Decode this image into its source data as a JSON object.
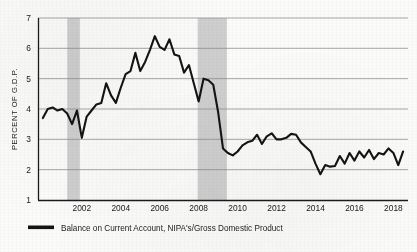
{
  "chart_data": {
    "type": "line",
    "title": "",
    "subtitle": "",
    "xlabel": "",
    "ylabel": "PERCENT OF G.D.P.",
    "xlim": [
      1999.75,
      2018.75
    ],
    "ylim": [
      1,
      7
    ],
    "yticks": [
      1,
      2,
      3,
      4,
      5,
      6,
      7
    ],
    "ytick_labels": [
      "1",
      "2",
      "3",
      "4",
      "5",
      "6",
      "7"
    ],
    "xticks": [
      2002,
      2004,
      2006,
      2008,
      2010,
      2012,
      2014,
      2016,
      2018
    ],
    "xtick_labels": [
      "2002",
      "2004",
      "2006",
      "2008",
      "2010",
      "2012",
      "2014",
      "2016",
      "2018"
    ],
    "grid": "horizontal",
    "legend_position": "below-left",
    "line_color": "#141414",
    "grid_color": "#8b8b8b",
    "axis_color": "#1b1b1b",
    "shading_color": "#cfcfcf",
    "background_color": "#fbfbfa",
    "shaded_regions": [
      {
        "label": "recession",
        "x_start": 2001.25,
        "x_end": 2001.9
      },
      {
        "label": "recession",
        "x_start": 2007.95,
        "x_end": 2009.45
      }
    ],
    "series": [
      {
        "name": "Balance on Current Account, NIPA's/Gross Domestic Product",
        "color": "#141414",
        "x": [
          2000.0,
          2000.25,
          2000.5,
          2000.75,
          2001.0,
          2001.25,
          2001.5,
          2001.75,
          2002.0,
          2002.25,
          2002.5,
          2002.75,
          2003.0,
          2003.25,
          2003.5,
          2003.75,
          2004.0,
          2004.25,
          2004.5,
          2004.75,
          2005.0,
          2005.25,
          2005.5,
          2005.75,
          2006.0,
          2006.25,
          2006.5,
          2006.75,
          2007.0,
          2007.25,
          2007.5,
          2007.75,
          2008.0,
          2008.25,
          2008.5,
          2008.75,
          2009.0,
          2009.25,
          2009.5,
          2009.75,
          2010.0,
          2010.25,
          2010.5,
          2010.75,
          2011.0,
          2011.25,
          2011.5,
          2011.75,
          2012.0,
          2012.25,
          2012.5,
          2012.75,
          2013.0,
          2013.25,
          2013.5,
          2013.75,
          2014.0,
          2014.25,
          2014.5,
          2014.75,
          2015.0,
          2015.25,
          2015.5,
          2015.75,
          2016.0,
          2016.25,
          2016.5,
          2016.75,
          2017.0,
          2017.25,
          2017.5,
          2017.75,
          2018.0,
          2018.25,
          2018.5
        ],
        "values": [
          3.7,
          4.0,
          4.05,
          3.95,
          4.0,
          3.85,
          3.5,
          3.95,
          3.05,
          3.75,
          3.95,
          4.15,
          4.2,
          4.85,
          4.45,
          4.2,
          4.7,
          5.15,
          5.25,
          5.85,
          5.25,
          5.55,
          5.95,
          6.4,
          6.05,
          5.95,
          6.3,
          5.8,
          5.75,
          5.2,
          5.45,
          4.85,
          4.25,
          5.0,
          4.95,
          4.8,
          3.9,
          2.7,
          2.55,
          2.47,
          2.6,
          2.8,
          2.9,
          2.95,
          3.15,
          2.85,
          3.1,
          3.2,
          3.0,
          3.0,
          3.05,
          3.18,
          3.15,
          2.9,
          2.75,
          2.6,
          2.2,
          1.85,
          2.15,
          2.1,
          2.12,
          2.45,
          2.2,
          2.55,
          2.3,
          2.6,
          2.4,
          2.65,
          2.35,
          2.55,
          2.5,
          2.7,
          2.55,
          2.15,
          2.6
        ]
      }
    ]
  },
  "legend": {
    "items": [
      {
        "swatch_color": "#141414",
        "label": "Balance on Current Account, NIPA's/Gross Domestic Product"
      }
    ]
  }
}
